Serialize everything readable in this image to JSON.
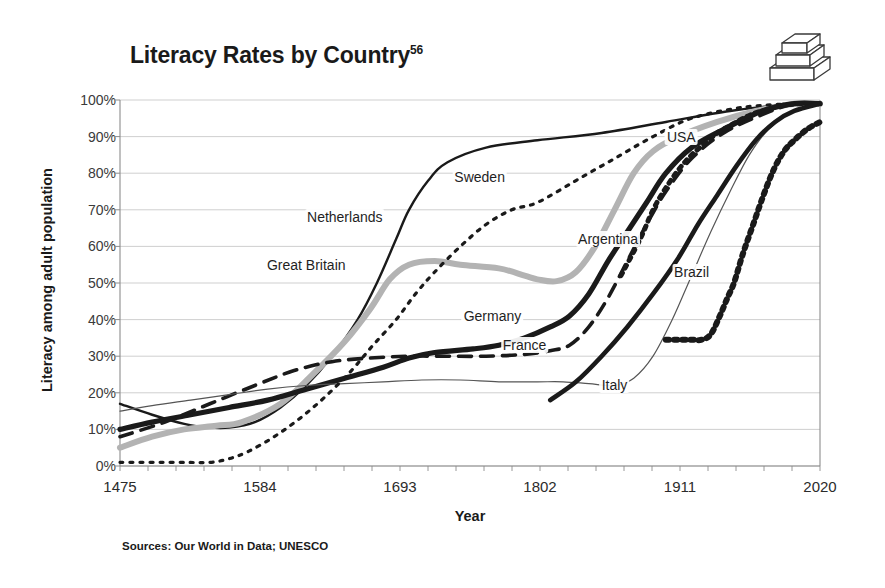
{
  "figure": {
    "title": "Literacy Rates by Country",
    "title_superscript": "56",
    "source_note": "Sources: Our World in Data; UNESCO",
    "icon": "stacked-books-icon"
  },
  "chart_data": {
    "type": "line",
    "title": "Literacy Rates by Country",
    "xlabel": "Year",
    "ylabel": "Literacy among adult population",
    "xlim": [
      1475,
      2020
    ],
    "ylim": [
      0,
      100
    ],
    "xticks": [
      "1475",
      "1584",
      "1693",
      "1802",
      "1911",
      "2020"
    ],
    "xtick_values": [
      1475,
      1584,
      1693,
      1802,
      1911,
      2020
    ],
    "yticks": [
      "0%",
      "10%",
      "20%",
      "30%",
      "40%",
      "50%",
      "60%",
      "70%",
      "80%",
      "90%",
      "100%"
    ],
    "ytick_values": [
      0,
      10,
      20,
      30,
      40,
      50,
      60,
      70,
      80,
      90,
      100
    ],
    "grid": "horizontal",
    "legend": "inline-labels",
    "series": [
      {
        "name": "Netherlands",
        "style": "solid-thin-black",
        "color": "#1a1a1a",
        "label_x": 1650,
        "label_y": 68,
        "points": [
          [
            1475,
            17
          ],
          [
            1500,
            14
          ],
          [
            1525,
            11.5
          ],
          [
            1545,
            10.5
          ],
          [
            1560,
            10.5
          ],
          [
            1580,
            12
          ],
          [
            1600,
            16
          ],
          [
            1620,
            22
          ],
          [
            1640,
            30
          ],
          [
            1660,
            40
          ],
          [
            1675,
            50
          ],
          [
            1690,
            62
          ],
          [
            1700,
            70
          ],
          [
            1715,
            78
          ],
          [
            1730,
            83
          ],
          [
            1760,
            87
          ],
          [
            1800,
            89
          ],
          [
            1850,
            91
          ],
          [
            1900,
            94
          ],
          [
            1950,
            97
          ],
          [
            2000,
            99
          ],
          [
            2020,
            99
          ]
        ]
      },
      {
        "name": "Great Britain",
        "style": "solid-thick-grey",
        "color": "#b3b3b3",
        "label_x": 1620,
        "label_y": 55,
        "points": [
          [
            1475,
            5
          ],
          [
            1500,
            8
          ],
          [
            1525,
            10
          ],
          [
            1550,
            11
          ],
          [
            1570,
            12
          ],
          [
            1600,
            17
          ],
          [
            1625,
            25
          ],
          [
            1650,
            34
          ],
          [
            1670,
            43
          ],
          [
            1685,
            51
          ],
          [
            1700,
            55
          ],
          [
            1720,
            56
          ],
          [
            1740,
            55
          ],
          [
            1770,
            54
          ],
          [
            1790,
            52
          ],
          [
            1800,
            51
          ],
          [
            1815,
            50.5
          ],
          [
            1830,
            53
          ],
          [
            1845,
            60
          ],
          [
            1860,
            70
          ],
          [
            1875,
            80
          ],
          [
            1890,
            86
          ],
          [
            1910,
            90
          ],
          [
            1940,
            94
          ],
          [
            1970,
            97
          ],
          [
            2000,
            99
          ],
          [
            2020,
            99
          ]
        ]
      },
      {
        "name": "Germany",
        "style": "solid-thick-black",
        "color": "#1a1a1a",
        "label_x": 1765,
        "label_y": 41,
        "points": [
          [
            1475,
            10
          ],
          [
            1500,
            12
          ],
          [
            1530,
            14
          ],
          [
            1560,
            16
          ],
          [
            1590,
            18
          ],
          [
            1620,
            21
          ],
          [
            1650,
            24
          ],
          [
            1680,
            27
          ],
          [
            1700,
            29.5
          ],
          [
            1720,
            31
          ],
          [
            1750,
            32
          ],
          [
            1770,
            33
          ],
          [
            1790,
            35
          ],
          [
            1810,
            38
          ],
          [
            1825,
            41
          ],
          [
            1840,
            47
          ],
          [
            1855,
            56
          ],
          [
            1870,
            64
          ],
          [
            1885,
            72
          ],
          [
            1900,
            80
          ],
          [
            1920,
            87
          ],
          [
            1945,
            92
          ],
          [
            1975,
            97
          ],
          [
            2000,
            99
          ],
          [
            2020,
            99
          ]
        ]
      },
      {
        "name": "France",
        "style": "dashed-black",
        "color": "#1a1a1a",
        "label_x": 1790,
        "label_y": 33,
        "points": [
          [
            1475,
            8
          ],
          [
            1510,
            12
          ],
          [
            1545,
            17
          ],
          [
            1580,
            22
          ],
          [
            1610,
            26
          ],
          [
            1640,
            28.5
          ],
          [
            1670,
            29.5
          ],
          [
            1700,
            30
          ],
          [
            1730,
            30
          ],
          [
            1760,
            30
          ],
          [
            1790,
            30.5
          ],
          [
            1810,
            31.5
          ],
          [
            1825,
            33
          ],
          [
            1840,
            38
          ],
          [
            1855,
            46
          ],
          [
            1870,
            56
          ],
          [
            1885,
            66
          ],
          [
            1900,
            75
          ],
          [
            1920,
            84
          ],
          [
            1945,
            91
          ],
          [
            1975,
            96
          ],
          [
            2000,
            99
          ],
          [
            2020,
            99
          ]
        ]
      },
      {
        "name": "Italy",
        "style": "solid-hairline-black",
        "color": "#555555",
        "label_x": 1860,
        "label_y": 22,
        "points": [
          [
            1475,
            15
          ],
          [
            1500,
            16.5
          ],
          [
            1530,
            18
          ],
          [
            1560,
            19.5
          ],
          [
            1590,
            21
          ],
          [
            1620,
            22
          ],
          [
            1650,
            22.5
          ],
          [
            1680,
            23
          ],
          [
            1710,
            23.5
          ],
          [
            1740,
            23.5
          ],
          [
            1770,
            23
          ],
          [
            1800,
            23
          ],
          [
            1820,
            23
          ],
          [
            1840,
            22.5
          ],
          [
            1860,
            22
          ],
          [
            1875,
            24
          ],
          [
            1890,
            30
          ],
          [
            1905,
            40
          ],
          [
            1920,
            52
          ],
          [
            1935,
            64
          ],
          [
            1950,
            75
          ],
          [
            1965,
            85
          ],
          [
            1980,
            92
          ],
          [
            2000,
            97
          ],
          [
            2020,
            99
          ]
        ]
      },
      {
        "name": "Sweden",
        "style": "dotted-black",
        "color": "#1a1a1a",
        "label_x": 1755,
        "label_y": 79,
        "points": [
          [
            1475,
            1
          ],
          [
            1520,
            1
          ],
          [
            1545,
            1
          ],
          [
            1560,
            2
          ],
          [
            1575,
            4
          ],
          [
            1595,
            8
          ],
          [
            1615,
            13
          ],
          [
            1635,
            19
          ],
          [
            1655,
            26
          ],
          [
            1672,
            33
          ],
          [
            1690,
            40
          ],
          [
            1705,
            47
          ],
          [
            1720,
            53
          ],
          [
            1740,
            60
          ],
          [
            1760,
            66
          ],
          [
            1780,
            70
          ],
          [
            1800,
            72
          ],
          [
            1830,
            78
          ],
          [
            1860,
            84
          ],
          [
            1890,
            90
          ],
          [
            1920,
            95
          ],
          [
            1960,
            98
          ],
          [
            2000,
            99
          ],
          [
            2020,
            99
          ]
        ]
      },
      {
        "name": "USA",
        "style": "beaded-dotted-black",
        "color": "#1a1a1a",
        "label_x": 1912,
        "label_y": 90,
        "points": [
          [
            1865,
            52
          ],
          [
            1880,
            62
          ],
          [
            1890,
            70
          ],
          [
            1900,
            76
          ],
          [
            1910,
            81
          ],
          [
            1920,
            85
          ],
          [
            1930,
            88
          ],
          [
            1940,
            91
          ],
          [
            1950,
            93
          ],
          [
            1960,
            95
          ],
          [
            1970,
            96.5
          ],
          [
            1980,
            97.5
          ],
          [
            1990,
            98.5
          ],
          [
            2005,
            99
          ],
          [
            2020,
            99
          ]
        ]
      },
      {
        "name": "Argentina",
        "style": "solid-thick-black-2",
        "color": "#1a1a1a",
        "label_x": 1855,
        "label_y": 62,
        "points": [
          [
            1810,
            18
          ],
          [
            1830,
            23
          ],
          [
            1850,
            30
          ],
          [
            1870,
            38
          ],
          [
            1890,
            47
          ],
          [
            1910,
            57
          ],
          [
            1925,
            66
          ],
          [
            1940,
            74
          ],
          [
            1955,
            82
          ],
          [
            1970,
            89
          ],
          [
            1985,
            94
          ],
          [
            2000,
            97
          ],
          [
            2020,
            99
          ]
        ]
      },
      {
        "name": "Brazil",
        "style": "beaded-dotted-thick-black",
        "color": "#1a1a1a",
        "label_x": 1920,
        "label_y": 53,
        "points": [
          [
            1900,
            34.5
          ],
          [
            1910,
            34.5
          ],
          [
            1920,
            34.5
          ],
          [
            1928,
            34.5
          ],
          [
            1935,
            36
          ],
          [
            1942,
            41
          ],
          [
            1948,
            46
          ],
          [
            1953,
            50
          ],
          [
            1960,
            58
          ],
          [
            1968,
            66
          ],
          [
            1976,
            74
          ],
          [
            1984,
            81
          ],
          [
            1992,
            86
          ],
          [
            2000,
            89
          ],
          [
            2010,
            92
          ],
          [
            2020,
            94
          ]
        ]
      }
    ]
  }
}
